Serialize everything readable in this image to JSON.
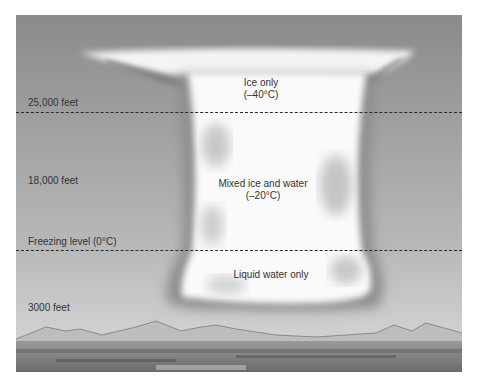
{
  "diagram": {
    "type": "cumulonimbus cloud cross-section",
    "altitude_labels": [
      {
        "label": "25,000 feet"
      },
      {
        "label": "18,000 feet"
      },
      {
        "label": "Freezing level (0°C)"
      },
      {
        "label": "3000 feet"
      }
    ],
    "zones": [
      {
        "title": "Ice only",
        "temp": "(–40°C)"
      },
      {
        "title": "Mixed ice and water",
        "temp": "(–20°C)"
      },
      {
        "title": "Liquid water only",
        "temp": ""
      }
    ],
    "colors": {
      "sky_top": "#8a8a8a",
      "sky_bottom": "#d8d8d8",
      "cloud": "#ffffff",
      "cloud_shadow": "#8e8e8e",
      "dashed_line": "#2a2a2a",
      "text": "#333333"
    }
  }
}
